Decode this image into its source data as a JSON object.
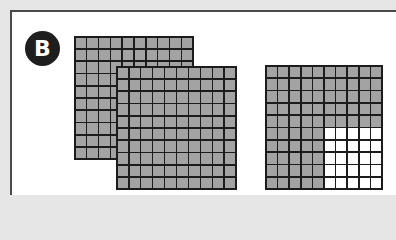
{
  "figure": {
    "label": "B",
    "colors": {
      "background": "#e6e6e6",
      "panel": "#ffffff",
      "border": "#4a4a4a",
      "badge": "#1e1e1e",
      "shaded_cell": "#a3a3a3",
      "unshaded_cell": "#ffffff",
      "grid_line": "#1c1c1c"
    },
    "grids": [
      {
        "id": "grid-back",
        "rows": 10,
        "cols": 10,
        "shaded": 100,
        "description": "full hundred grid (back, overlapped)"
      },
      {
        "id": "grid-front",
        "rows": 10,
        "cols": 10,
        "shaded": 100,
        "description": "full hundred grid (front)"
      },
      {
        "id": "grid-part",
        "rows": 10,
        "cols": 10,
        "shaded": 75,
        "unshaded_block": {
          "row_start": 5,
          "col_start": 5,
          "rows": 5,
          "cols": 5
        },
        "description": "hundred grid with bottom-right 5x5 unshaded"
      }
    ],
    "represented_value": 2.75
  }
}
